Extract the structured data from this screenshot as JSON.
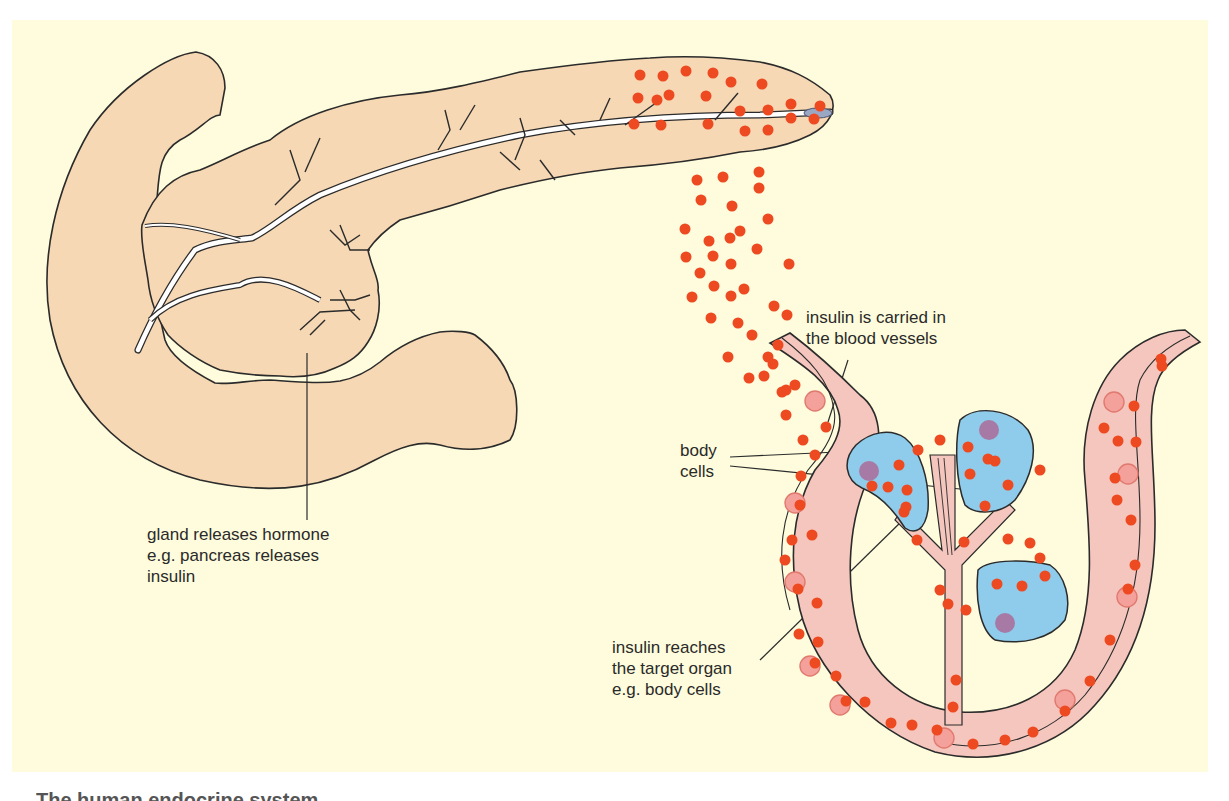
{
  "figure": {
    "colors": {
      "background_panel": "#fefcdc",
      "pancreas_fill": "#f6d8b4",
      "outline": "#2b2b2b",
      "insulin_dot": "#ee4a22",
      "vessel_fill": "#f5c6bd",
      "vessel_wall": "#e49a90",
      "red_cell_fill": "#f3a19a",
      "body_cell_fill": "#8fcbea",
      "nucleus_fill": "#a77aa6",
      "duct_fill": "#ffffff"
    }
  },
  "labels": {
    "gland": "gland releases hormone\ne.g. pancreas releases\ninsulin",
    "carried": "insulin is carried in\nthe blood vessels",
    "body_cells": "body\ncells",
    "reaches": "insulin reaches\nthe target organ\ne.g. body cells"
  },
  "caption": {
    "text": "The human endocrine system"
  },
  "insulin_dots": {
    "in_gland": [
      [
        640,
        75
      ],
      [
        663,
        76
      ],
      [
        686,
        71
      ],
      [
        713,
        73
      ],
      [
        731,
        82
      ],
      [
        638,
        98
      ],
      [
        657,
        100
      ],
      [
        669,
        95
      ],
      [
        762,
        84
      ],
      [
        706,
        96
      ],
      [
        634,
        124
      ],
      [
        661,
        125
      ],
      [
        708,
        124
      ],
      [
        740,
        111
      ],
      [
        768,
        110
      ],
      [
        791,
        104
      ],
      [
        791,
        118
      ],
      [
        768,
        130
      ],
      [
        745,
        131
      ],
      [
        820,
        106
      ],
      [
        814,
        119
      ]
    ],
    "falling": [
      [
        697,
        180
      ],
      [
        723,
        177
      ],
      [
        759,
        172
      ],
      [
        759,
        188
      ],
      [
        701,
        200
      ],
      [
        732,
        206
      ],
      [
        768,
        219
      ],
      [
        685,
        229
      ],
      [
        709,
        241
      ],
      [
        730,
        238
      ],
      [
        740,
        231
      ],
      [
        757,
        249
      ],
      [
        686,
        257
      ],
      [
        713,
        256
      ],
      [
        731,
        264
      ],
      [
        700,
        273
      ],
      [
        744,
        289
      ],
      [
        714,
        286
      ],
      [
        692,
        297
      ],
      [
        731,
        296
      ],
      [
        789,
        264
      ],
      [
        711,
        318
      ],
      [
        738,
        323
      ],
      [
        774,
        306
      ],
      [
        787,
        315
      ],
      [
        752,
        335
      ],
      [
        778,
        345
      ],
      [
        728,
        357
      ],
      [
        768,
        357
      ],
      [
        749,
        378
      ],
      [
        764,
        376
      ],
      [
        786,
        390
      ]
    ]
  },
  "vessel_dots": [
    [
      773,
      364
    ],
    [
      782,
      392
    ],
    [
      795,
      385
    ],
    [
      786,
      415
    ],
    [
      826,
      427
    ],
    [
      803,
      440
    ],
    [
      815,
      455
    ],
    [
      801,
      476
    ],
    [
      800,
      505
    ],
    [
      792,
      540
    ],
    [
      812,
      535
    ],
    [
      785,
      560
    ],
    [
      798,
      589
    ],
    [
      817,
      603
    ],
    [
      799,
      634
    ],
    [
      818,
      642
    ],
    [
      815,
      663
    ],
    [
      836,
      676
    ],
    [
      846,
      701
    ],
    [
      865,
      702
    ],
    [
      891,
      723
    ],
    [
      912,
      725
    ],
    [
      937,
      730
    ],
    [
      973,
      744
    ],
    [
      1005,
      740
    ],
    [
      1033,
      732
    ],
    [
      1065,
      711
    ],
    [
      1090,
      681
    ],
    [
      1110,
      640
    ],
    [
      1128,
      589
    ],
    [
      1135,
      565
    ],
    [
      1131,
      520
    ],
    [
      1117,
      500
    ],
    [
      1115,
      478
    ],
    [
      1104,
      428
    ],
    [
      1118,
      441
    ],
    [
      1134,
      406
    ],
    [
      1136,
      442
    ],
    [
      1161,
      359
    ],
    [
      1162,
      366
    ]
  ],
  "branch_dots": [
    [
      872,
      486
    ],
    [
      904,
      512
    ],
    [
      918,
      450
    ],
    [
      940,
      440
    ],
    [
      988,
      459
    ],
    [
      1040,
      470
    ],
    [
      1008,
      539
    ],
    [
      1030,
      543
    ],
    [
      1040,
      558
    ],
    [
      940,
      590
    ],
    [
      948,
      604
    ],
    [
      956,
      680
    ],
    [
      953,
      707
    ],
    [
      966,
      610
    ],
    [
      964,
      542
    ],
    [
      917,
      540
    ]
  ],
  "cell_dots": {
    "cell1": [
      [
        899,
        465
      ],
      [
        907,
        490
      ],
      [
        888,
        487
      ],
      [
        906,
        507
      ]
    ],
    "cell2": [
      [
        968,
        447
      ],
      [
        995,
        461
      ],
      [
        970,
        474
      ],
      [
        1008,
        485
      ],
      [
        985,
        506
      ]
    ],
    "cell3": [
      [
        997,
        584
      ],
      [
        1022,
        586
      ],
      [
        1045,
        576
      ]
    ]
  }
}
